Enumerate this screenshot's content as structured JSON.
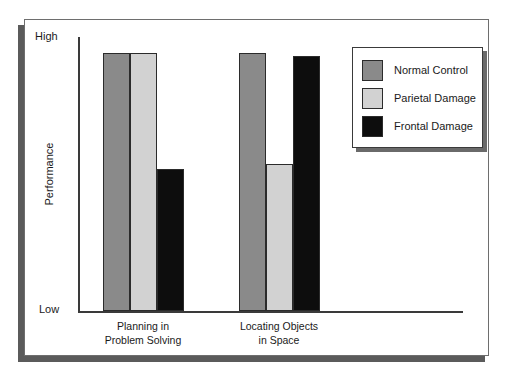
{
  "chart_data": {
    "type": "bar",
    "title": "",
    "xlabel": "",
    "ylabel": "Performance",
    "ylim": [
      0,
      100
    ],
    "y_tick_labels": [
      "Low",
      "High"
    ],
    "grid": false,
    "legend_position": "top-right",
    "categories": [
      "Planning in\nProblem Solving",
      "Locating Objects\nin Space"
    ],
    "category_lines": [
      [
        "Planning in",
        "Problem Solving"
      ],
      [
        "Locating Objects",
        "in Space"
      ]
    ],
    "series": [
      {
        "name": "Normal Control",
        "color": "#8a8a8a",
        "values": [
          100,
          100
        ]
      },
      {
        "name": "Parietal Damage",
        "color": "#d2d2d2",
        "values": [
          100,
          57
        ]
      },
      {
        "name": "Frontal Damage",
        "color": "#0d0d0d",
        "values": [
          55,
          99
        ]
      }
    ]
  },
  "axes": {
    "y_label": "Performance",
    "y_high": "High",
    "y_low": "Low"
  },
  "legend": {
    "items": [
      {
        "label": "Normal Control",
        "color": "#8a8a8a"
      },
      {
        "label": "Parietal Damage",
        "color": "#d2d2d2"
      },
      {
        "label": "Frontal Damage",
        "color": "#0d0d0d"
      }
    ]
  },
  "colors": {
    "series_normal": "#8a8a8a",
    "series_parietal": "#d2d2d2",
    "series_frontal": "#0d0d0d",
    "axis": "#3a3a3a",
    "frame": "#6e6e6e",
    "shadow": "#5b5b5b",
    "background": "#ffffff"
  }
}
